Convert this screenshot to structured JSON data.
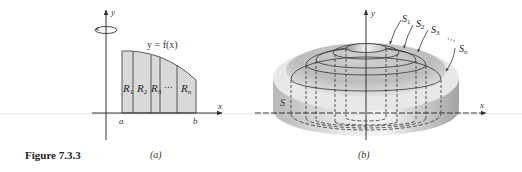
{
  "figure": {
    "caption": "Figure 7.3.3",
    "panel_a": {
      "label": "(a)",
      "y_axis_label": "y",
      "x_axis_label": "x",
      "curve_label": "y = f(x)",
      "left_bound": "a",
      "right_bound": "b",
      "region_labels": [
        "R",
        "R",
        "R",
        "⋯",
        "R"
      ],
      "region_subscripts": [
        "1",
        "2",
        "3",
        "",
        "n"
      ],
      "rotation_icon": "rotation-arrow-icon"
    },
    "panel_b": {
      "label": "(b)",
      "y_axis_label": "y",
      "x_axis_label": "x",
      "solid_label": "S",
      "shell_labels": [
        "S",
        "S",
        "S",
        "⋯",
        "S"
      ],
      "shell_subscripts": [
        "1",
        "2",
        "3",
        "",
        "n"
      ]
    },
    "colors": {
      "region_fill": "#d9d9d9",
      "line": "#333333",
      "solid_light": "#f2f2f2",
      "solid_mid": "#cfcfcf",
      "solid_dark": "#a8a8a8"
    }
  }
}
